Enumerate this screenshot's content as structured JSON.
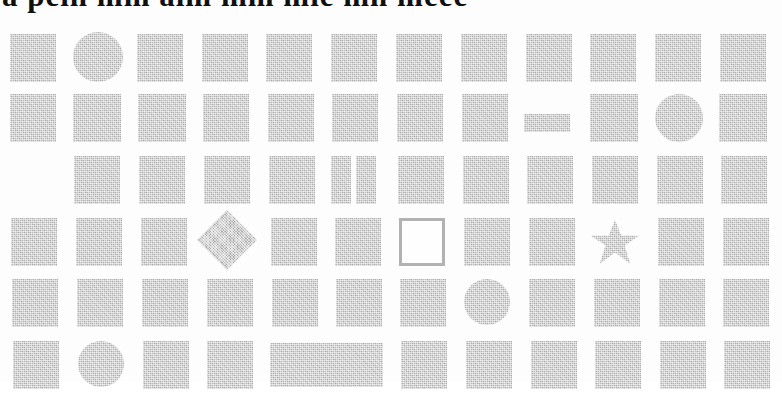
{
  "document": {
    "type": "scanned-page",
    "header_fragment_text": "a pein mm aim mm mie mn meee",
    "background_color": "#fdfdfd",
    "block_color": "#b3b3b3",
    "outline_color": "#b0b0b0",
    "text_color": "#101010",
    "columns": 12,
    "rows": 6
  },
  "grid": {
    "rows": [
      {
        "index": 1,
        "top": 13,
        "cells": [
          {
            "col": 1,
            "shape": "square",
            "x": 10,
            "y": 8,
            "w": 46,
            "h": 48
          },
          {
            "col": 2,
            "shape": "circle",
            "x": 73,
            "y": 6,
            "w": 50,
            "h": 50
          },
          {
            "col": 3,
            "shape": "square",
            "x": 137,
            "y": 8,
            "w": 46,
            "h": 48
          },
          {
            "col": 4,
            "shape": "square",
            "x": 202,
            "y": 8,
            "w": 46,
            "h": 48
          },
          {
            "col": 5,
            "shape": "square",
            "x": 266,
            "y": 8,
            "w": 46,
            "h": 48
          },
          {
            "col": 6,
            "shape": "square",
            "x": 331,
            "y": 8,
            "w": 46,
            "h": 48
          },
          {
            "col": 7,
            "shape": "square",
            "x": 396,
            "y": 8,
            "w": 46,
            "h": 48
          },
          {
            "col": 8,
            "shape": "square",
            "x": 461,
            "y": 8,
            "w": 46,
            "h": 48
          },
          {
            "col": 9,
            "shape": "square",
            "x": 526,
            "y": 8,
            "w": 46,
            "h": 48
          },
          {
            "col": 10,
            "shape": "square",
            "x": 590,
            "y": 8,
            "w": 46,
            "h": 48
          },
          {
            "col": 11,
            "shape": "square",
            "x": 655,
            "y": 8,
            "w": 46,
            "h": 48
          },
          {
            "col": 12,
            "shape": "square",
            "x": 720,
            "y": 8,
            "w": 46,
            "h": 48
          }
        ]
      },
      {
        "index": 2,
        "top": 75,
        "cells": [
          {
            "col": 1,
            "shape": "square",
            "x": 10,
            "y": 6,
            "w": 46,
            "h": 48
          },
          {
            "col": 2,
            "shape": "square",
            "x": 73,
            "y": 6,
            "w": 48,
            "h": 48
          },
          {
            "col": 3,
            "shape": "square",
            "x": 138,
            "y": 6,
            "w": 48,
            "h": 48
          },
          {
            "col": 4,
            "shape": "square",
            "x": 203,
            "y": 6,
            "w": 46,
            "h": 48
          },
          {
            "col": 5,
            "shape": "square",
            "x": 268,
            "y": 6,
            "w": 46,
            "h": 48
          },
          {
            "col": 6,
            "shape": "square",
            "x": 332,
            "y": 6,
            "w": 46,
            "h": 48
          },
          {
            "col": 7,
            "shape": "square",
            "x": 397,
            "y": 6,
            "w": 46,
            "h": 48
          },
          {
            "col": 8,
            "shape": "square",
            "x": 462,
            "y": 6,
            "w": 46,
            "h": 48
          },
          {
            "col": 9,
            "shape": "bar",
            "x": 524,
            "y": 26,
            "w": 46,
            "h": 18
          },
          {
            "col": 10,
            "shape": "square",
            "x": 590,
            "y": 6,
            "w": 48,
            "h": 48
          },
          {
            "col": 11,
            "shape": "circle",
            "x": 655,
            "y": 6,
            "w": 48,
            "h": 48
          },
          {
            "col": 12,
            "shape": "square",
            "x": 719,
            "y": 6,
            "w": 48,
            "h": 48
          }
        ]
      },
      {
        "index": 3,
        "top": 135,
        "cells": [
          {
            "col": 2,
            "shape": "square",
            "x": 74,
            "y": 8,
            "w": 46,
            "h": 48
          },
          {
            "col": 3,
            "shape": "square",
            "x": 139,
            "y": 8,
            "w": 46,
            "h": 48
          },
          {
            "col": 4,
            "shape": "square",
            "x": 204,
            "y": 8,
            "w": 46,
            "h": 48
          },
          {
            "col": 5,
            "shape": "square",
            "x": 269,
            "y": 8,
            "w": 46,
            "h": 48
          },
          {
            "col": 6,
            "shape": "split-left",
            "x": 331,
            "y": 8,
            "w": 20,
            "h": 48
          },
          {
            "col": 6,
            "shape": "split-right",
            "x": 356,
            "y": 8,
            "w": 20,
            "h": 48
          },
          {
            "col": 7,
            "shape": "square",
            "x": 398,
            "y": 8,
            "w": 46,
            "h": 48
          },
          {
            "col": 8,
            "shape": "square",
            "x": 463,
            "y": 8,
            "w": 46,
            "h": 48
          },
          {
            "col": 9,
            "shape": "square",
            "x": 527,
            "y": 8,
            "w": 46,
            "h": 48
          },
          {
            "col": 10,
            "shape": "square",
            "x": 592,
            "y": 8,
            "w": 46,
            "h": 48
          },
          {
            "col": 11,
            "shape": "square",
            "x": 657,
            "y": 8,
            "w": 46,
            "h": 48
          },
          {
            "col": 12,
            "shape": "square",
            "x": 721,
            "y": 8,
            "w": 46,
            "h": 48
          }
        ]
      },
      {
        "index": 4,
        "top": 196,
        "cells": [
          {
            "col": 1,
            "shape": "square",
            "x": 11,
            "y": 9,
            "w": 46,
            "h": 48
          },
          {
            "col": 2,
            "shape": "square",
            "x": 76,
            "y": 9,
            "w": 46,
            "h": 48
          },
          {
            "col": 3,
            "shape": "square",
            "x": 141,
            "y": 9,
            "w": 46,
            "h": 48
          },
          {
            "col": 4,
            "shape": "diamond",
            "x": 206,
            "y": 10,
            "w": 42,
            "h": 42
          },
          {
            "col": 5,
            "shape": "square",
            "x": 271,
            "y": 9,
            "w": 46,
            "h": 48
          },
          {
            "col": 6,
            "shape": "square",
            "x": 335,
            "y": 9,
            "w": 46,
            "h": 48
          },
          {
            "col": 7,
            "shape": "hollow-square",
            "x": 399,
            "y": 9,
            "w": 46,
            "h": 48
          },
          {
            "col": 8,
            "shape": "square",
            "x": 464,
            "y": 9,
            "w": 46,
            "h": 48
          },
          {
            "col": 9,
            "shape": "square",
            "x": 529,
            "y": 9,
            "w": 46,
            "h": 48
          },
          {
            "col": 10,
            "shape": "star",
            "x": 591,
            "y": 11,
            "w": 48,
            "h": 44
          },
          {
            "col": 11,
            "shape": "square",
            "x": 658,
            "y": 9,
            "w": 46,
            "h": 48
          },
          {
            "col": 12,
            "shape": "square",
            "x": 723,
            "y": 9,
            "w": 46,
            "h": 48
          }
        ]
      },
      {
        "index": 5,
        "top": 257,
        "cells": [
          {
            "col": 1,
            "shape": "square",
            "x": 12,
            "y": 9,
            "w": 46,
            "h": 48
          },
          {
            "col": 2,
            "shape": "square",
            "x": 77,
            "y": 9,
            "w": 46,
            "h": 48
          },
          {
            "col": 3,
            "shape": "square",
            "x": 142,
            "y": 9,
            "w": 46,
            "h": 48
          },
          {
            "col": 4,
            "shape": "square",
            "x": 207,
            "y": 9,
            "w": 46,
            "h": 48
          },
          {
            "col": 5,
            "shape": "square",
            "x": 272,
            "y": 9,
            "w": 46,
            "h": 48
          },
          {
            "col": 6,
            "shape": "square",
            "x": 336,
            "y": 9,
            "w": 46,
            "h": 48
          },
          {
            "col": 7,
            "shape": "square",
            "x": 400,
            "y": 9,
            "w": 46,
            "h": 48
          },
          {
            "col": 8,
            "shape": "circle",
            "x": 464,
            "y": 9,
            "w": 46,
            "h": 46
          },
          {
            "col": 9,
            "shape": "square",
            "x": 529,
            "y": 9,
            "w": 46,
            "h": 48
          },
          {
            "col": 10,
            "shape": "square",
            "x": 594,
            "y": 9,
            "w": 46,
            "h": 48
          },
          {
            "col": 11,
            "shape": "square",
            "x": 659,
            "y": 9,
            "w": 46,
            "h": 48
          },
          {
            "col": 12,
            "shape": "square",
            "x": 723,
            "y": 9,
            "w": 46,
            "h": 48
          }
        ]
      },
      {
        "index": 6,
        "top": 318,
        "cells": [
          {
            "col": 1,
            "shape": "square",
            "x": 13,
            "y": 10,
            "w": 46,
            "h": 48
          },
          {
            "col": 2,
            "shape": "circle",
            "x": 78,
            "y": 10,
            "w": 46,
            "h": 46
          },
          {
            "col": 3,
            "shape": "square",
            "x": 143,
            "y": 10,
            "w": 46,
            "h": 48
          },
          {
            "col": 4,
            "shape": "square",
            "x": 207,
            "y": 10,
            "w": 46,
            "h": 48
          },
          {
            "col": 5,
            "shape": "wide-rect",
            "x": 270,
            "y": 12,
            "w": 113,
            "h": 44
          },
          {
            "col": 7,
            "shape": "square",
            "x": 401,
            "y": 10,
            "w": 46,
            "h": 48
          },
          {
            "col": 8,
            "shape": "square",
            "x": 466,
            "y": 10,
            "w": 46,
            "h": 48
          },
          {
            "col": 9,
            "shape": "square",
            "x": 531,
            "y": 10,
            "w": 46,
            "h": 48
          },
          {
            "col": 10,
            "shape": "square",
            "x": 595,
            "y": 10,
            "w": 46,
            "h": 48
          },
          {
            "col": 11,
            "shape": "square",
            "x": 660,
            "y": 10,
            "w": 46,
            "h": 48
          },
          {
            "col": 12,
            "shape": "square",
            "x": 724,
            "y": 10,
            "w": 46,
            "h": 48
          }
        ]
      }
    ]
  }
}
